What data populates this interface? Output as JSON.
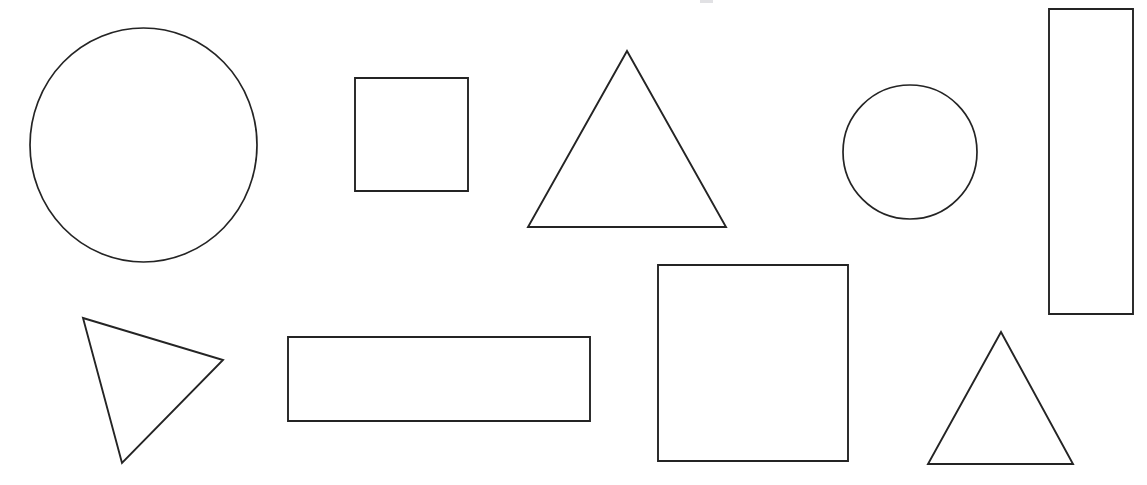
{
  "figure": {
    "width": 1147,
    "height": 485,
    "background_color": "#ffffff",
    "stroke_color": "#242424",
    "fill": "none",
    "stroke_width": 1.9,
    "shape_count": 10
  },
  "shapes": [
    {
      "id": "large-circle",
      "name": "large-circle",
      "type": "ellipse",
      "label": "Large circle",
      "cx": 143.5,
      "cy": 145,
      "rx": 113.5,
      "ry": 117,
      "bounds": {
        "x": 30,
        "y": 28,
        "width": 227,
        "height": 234
      },
      "row": "top",
      "order": 1
    },
    {
      "id": "small-square",
      "name": "small-square",
      "type": "rect",
      "label": "Small square",
      "x": 355,
      "y": 78,
      "width": 113,
      "height": 113,
      "bounds": {
        "x": 355,
        "y": 78,
        "width": 113,
        "height": 113
      },
      "row": "top",
      "order": 2
    },
    {
      "id": "large-triangle",
      "name": "large-triangle",
      "type": "polygon",
      "label": "Large upright triangle",
      "points": "627,51 726,227 528,227",
      "vertices": [
        [
          627,
          51
        ],
        [
          726,
          227
        ],
        [
          528,
          227
        ]
      ],
      "bounds": {
        "x": 528,
        "y": 51,
        "width": 198,
        "height": 176
      },
      "row": "top",
      "order": 3
    },
    {
      "id": "small-circle",
      "name": "small-circle",
      "type": "ellipse",
      "label": "Small circle",
      "cx": 910,
      "cy": 152,
      "rx": 67,
      "ry": 67,
      "bounds": {
        "x": 843,
        "y": 85,
        "width": 134,
        "height": 134
      },
      "row": "top",
      "order": 4
    },
    {
      "id": "tall-rectangle",
      "name": "tall-rectangle",
      "type": "rect",
      "label": "Tall vertical rectangle",
      "x": 1049,
      "y": 9,
      "width": 84,
      "height": 305,
      "bounds": {
        "x": 1049,
        "y": 9,
        "width": 84,
        "height": 305
      },
      "row": "top",
      "order": 5
    },
    {
      "id": "rotated-triangle",
      "name": "rotated-triangle",
      "type": "polygon",
      "label": "Rotated scalene triangle",
      "points": "83,318 223,360 122,463",
      "vertices": [
        [
          83,
          318
        ],
        [
          223,
          360
        ],
        [
          122,
          463
        ]
      ],
      "bounds": {
        "x": 83,
        "y": 318,
        "width": 140,
        "height": 145
      },
      "row": "bottom",
      "order": 6
    },
    {
      "id": "wide-rectangle",
      "name": "wide-rectangle",
      "type": "rect",
      "label": "Wide horizontal rectangle",
      "x": 288,
      "y": 337,
      "width": 302,
      "height": 84,
      "bounds": {
        "x": 288,
        "y": 337,
        "width": 302,
        "height": 84
      },
      "row": "bottom",
      "order": 7
    },
    {
      "id": "large-square",
      "name": "large-square",
      "type": "rect",
      "label": "Large square",
      "x": 658,
      "y": 265,
      "width": 190,
      "height": 196,
      "bounds": {
        "x": 658,
        "y": 265,
        "width": 190,
        "height": 196
      },
      "row": "bottom",
      "order": 8
    },
    {
      "id": "small-triangle",
      "name": "small-triangle",
      "type": "polygon",
      "label": "Small upright triangle",
      "points": "1001,332 1073,464 928,464",
      "vertices": [
        [
          1001,
          332
        ],
        [
          1073,
          464
        ],
        [
          928,
          464
        ]
      ],
      "bounds": {
        "x": 928,
        "y": 332,
        "width": 145,
        "height": 132
      },
      "row": "bottom",
      "order": 9
    },
    {
      "id": "top-edge-artifact",
      "name": "top-edge-artifact",
      "type": "artifact",
      "label": "Faint cropped mark at top edge",
      "x": 700,
      "y": 0,
      "width": 13,
      "height": 3,
      "bounds": {
        "x": 700,
        "y": 0,
        "width": 13,
        "height": 3
      },
      "row": "top",
      "order": 10
    }
  ],
  "shape_counts": {
    "circles": 2,
    "squares": 2,
    "rectangles": 2,
    "triangles": 3
  }
}
